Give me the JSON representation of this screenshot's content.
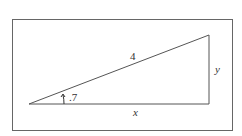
{
  "diagram": {
    "type": "right-triangle",
    "labels": {
      "hypotenuse": "4",
      "opposite": "y",
      "adjacent": "x",
      "angle": ".7"
    },
    "colors": {
      "stroke": "#555555",
      "frame": "#666666",
      "background": "#ffffff"
    }
  }
}
